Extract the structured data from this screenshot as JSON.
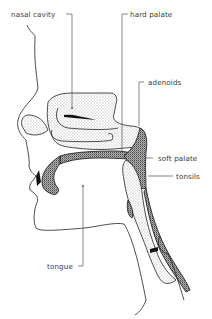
{
  "diagram": {
    "labels": {
      "nasal_cavity": "nasal cavity",
      "hard_palate": "hard palate",
      "adenoids": "adenoids",
      "soft_palate": "soft palate",
      "tonsils": "tonsils",
      "tongue": "tongue"
    },
    "colors": {
      "ink": "#222222",
      "label": "#3a3a3a",
      "background": "#ffffff"
    }
  }
}
